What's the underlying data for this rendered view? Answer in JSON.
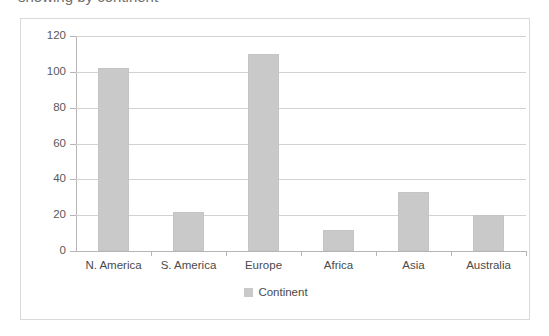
{
  "page": {
    "clipped_heading_sliver": "showing by continent"
  },
  "chart_data": {
    "type": "bar",
    "title": "",
    "xlabel": "",
    "ylabel": "",
    "categories": [
      "N. America",
      "S. America",
      "Europe",
      "Africa",
      "Asia",
      "Australia"
    ],
    "values": [
      102,
      22,
      110,
      12,
      33,
      20
    ],
    "series": [
      {
        "name": "Continent",
        "values": [
          102,
          22,
          110,
          12,
          33,
          20
        ]
      }
    ],
    "ylim": [
      0,
      120
    ],
    "y_ticks": [
      0,
      20,
      40,
      60,
      80,
      100,
      120
    ],
    "y_tick_labels": [
      "0",
      "20",
      "40",
      "60",
      "80",
      "100",
      "120"
    ],
    "grid": true,
    "legend": {
      "position": "bottom",
      "entries": [
        "Continent"
      ]
    },
    "colors": {
      "bar_fill": "#c9c9c9",
      "bar_stroke": "#c4c4c4",
      "gridline": "#d2d2d2",
      "axis": "#b5b5b5",
      "text": "#4a4a4a",
      "frame_border": "#d9d9d9",
      "background": "#ffffff"
    }
  }
}
